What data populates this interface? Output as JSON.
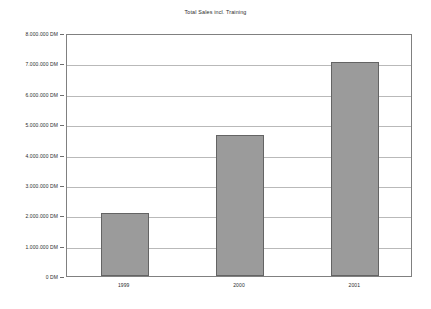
{
  "chart_data": {
    "type": "bar",
    "title": "Total Sales incl. Training",
    "xlabel": "",
    "ylabel": "",
    "categories": [
      "1999",
      "2000",
      "2001"
    ],
    "values": [
      2070000,
      4630000,
      7050000
    ],
    "value_labels": [
      "2.070.000 DM",
      "4.630.000 DM",
      "7.050.000 DM"
    ],
    "series": [
      {
        "name": "Total Sales incl. Training",
        "values": [
          2070000,
          4630000,
          7050000
        ]
      }
    ],
    "ylim": [
      0,
      8000000
    ],
    "y_tick_values": [
      0,
      1000000,
      2000000,
      3000000,
      4000000,
      5000000,
      6000000,
      7000000,
      8000000
    ],
    "y_tick_labels": [
      "0 DM",
      "1.000.000 DM",
      "2.000.000 DM",
      "3.000.000 DM",
      "4.000.000 DM",
      "5.000.000 DM",
      "6.000.000 DM",
      "7.000.000 DM",
      "8.000.000 DM"
    ],
    "currency": "DM",
    "grid": true,
    "grid_axis": "y",
    "legend": false,
    "legend_position": "none",
    "bar_color": "#9b9b9b",
    "bar_border_color": "#646464",
    "grid_color": "#b9b9b9",
    "axis_color": "#808080",
    "background_color": "#ffffff",
    "text_color": "#2b2b2b"
  }
}
